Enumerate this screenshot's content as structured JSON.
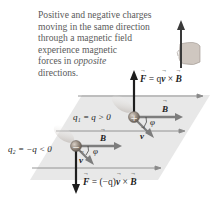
{
  "caption": {
    "line1": "Positive and negative charges",
    "line2": "moving in the same direction",
    "line3": "through a magnetic field",
    "line4": "experience magnetic",
    "line5_pre": "forces in ",
    "line5_em": "opposite",
    "line6": "directions."
  },
  "labels": {
    "force_top_F": "F",
    "force_top_eq": " = q",
    "force_top_v": "v",
    "force_top_cross": " × ",
    "force_top_B": "B",
    "force_bottom_F": "F",
    "force_bottom_eq": " = (−q)",
    "force_bottom_v": "v",
    "force_bottom_cross": " × ",
    "force_bottom_B": "B",
    "q1_label": "q₁ = q > 0",
    "q2_label": "q₂ = −q < 0",
    "B1": "B",
    "B2": "B",
    "v1": "v",
    "v2": "v",
    "phi1": "φ",
    "phi2": "φ",
    "plus_sign": "+",
    "minus_sign": "−"
  },
  "colors": {
    "plane": "#e6e6e6",
    "field_line": "#8a8a8a",
    "arrow_gray": "#7d7d7d",
    "force_arrow": "#1e1e1e",
    "charge": "#9a8f86",
    "text_gray": "#5a5a5a"
  }
}
